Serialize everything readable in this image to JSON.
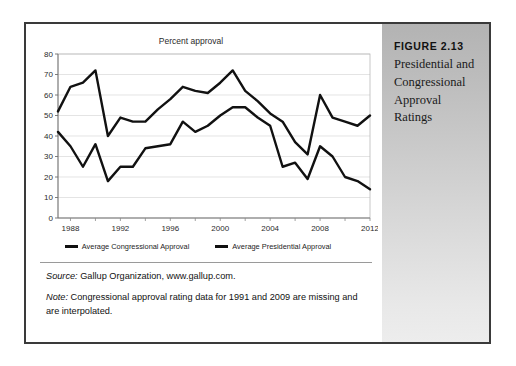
{
  "figure": {
    "number_label": "FIGURE 2.13",
    "caption": "Presidential and Congressional Approval Ratings"
  },
  "notes": {
    "source_lead": "Source:",
    "source_text": " Gallup Organization, www.gallup.com.",
    "note_lead": "Note:",
    "note_text": " Congressional approval rating data for 1991 and 2009 are missing and are interpolated."
  },
  "chart_data": {
    "type": "line",
    "title": "Percent approval",
    "xlabel": "",
    "ylabel": "",
    "ylim": [
      0,
      80
    ],
    "ytick_step": 10,
    "yticks": [
      0,
      10,
      20,
      30,
      40,
      50,
      60,
      70,
      80
    ],
    "xlim": [
      1987,
      2012
    ],
    "xticks": [
      1988,
      1992,
      1996,
      2000,
      2004,
      2008,
      2012
    ],
    "xtick_labels": [
      "1988",
      "1992",
      "1996",
      "2000",
      "2004",
      "2008",
      "2012"
    ],
    "minor_xtick_step": 2,
    "grid": "horizontal",
    "legend_position": "bottom",
    "line_color": "#111111",
    "x": [
      1987,
      1988,
      1989,
      1990,
      1991,
      1992,
      1993,
      1994,
      1995,
      1996,
      1997,
      1998,
      1999,
      2000,
      2001,
      2002,
      2003,
      2004,
      2005,
      2006,
      2007,
      2008,
      2009,
      2010,
      2011,
      2012
    ],
    "series": [
      {
        "name": "Average Presidential Approval",
        "values": [
          52,
          64,
          66,
          72,
          40,
          49,
          47,
          47,
          53,
          58,
          64,
          62,
          61,
          66,
          72,
          62,
          57,
          51,
          47,
          37,
          31,
          60,
          49,
          47,
          45,
          50
        ]
      },
      {
        "name": "Average Congressional Approval",
        "values": [
          42,
          35,
          25,
          36,
          18,
          25,
          25,
          34,
          35,
          36,
          47,
          42,
          45,
          50,
          54,
          54,
          49,
          45,
          25,
          27,
          19,
          35,
          30,
          20,
          18,
          14
        ]
      }
    ]
  }
}
